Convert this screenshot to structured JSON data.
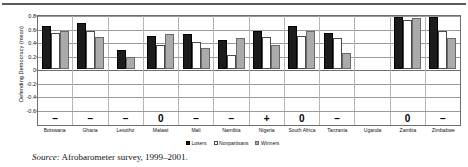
{
  "chart_data": {
    "type": "bar",
    "title": "",
    "subtitle": "",
    "xlabel": "",
    "ylabel": "Defending Democracy (mean)",
    "ylim": [
      -0.6,
      0.8
    ],
    "yticks": [
      0.8,
      0.6,
      0.4,
      0.2,
      0,
      -0.2,
      -0.4,
      -0.6
    ],
    "ytick_labels": [
      "0.8",
      "0.6",
      "0.4",
      "0.2",
      "0",
      "-0.2",
      "-0.4",
      "-0.6"
    ],
    "grid": true,
    "legend_position": "bottom-center",
    "categories": [
      "Botswana",
      "Ghana",
      "Lesotho",
      "Malawi",
      "Mali",
      "Namibia",
      "Nigeria",
      "South Africa",
      "Tanzania",
      "Uganda",
      "Zambia",
      "Zimbabwe"
    ],
    "series": [
      {
        "name": "Losers",
        "color": "#1c1c1c",
        "values": [
          0.63,
          0.67,
          0.28,
          0.48,
          0.51,
          0.43,
          0.56,
          0.62,
          0.52,
          null,
          0.76,
          0.75
        ]
      },
      {
        "name": "Nonpartisans",
        "color": "#ffffff",
        "values": [
          0.53,
          0.56,
          null,
          0.35,
          0.4,
          0.21,
          0.47,
          0.48,
          0.45,
          null,
          0.72,
          0.55
        ]
      },
      {
        "name": "Winners",
        "color": "#ababab",
        "values": [
          0.56,
          0.47,
          0.18,
          0.51,
          0.31,
          0.45,
          0.36,
          0.55,
          0.24,
          null,
          0.74,
          0.46
        ]
      }
    ],
    "annotations": {
      "significance_row_name": "winner-loser gap sign",
      "signs": [
        "–",
        "–",
        "–",
        "0",
        "–",
        "–",
        "+",
        "0",
        "–",
        "",
        "0",
        "–"
      ]
    }
  },
  "legend": {
    "items": [
      {
        "label": "Losers",
        "swatch": "losers"
      },
      {
        "label": "Nonpartisans",
        "swatch": "nonpartisans"
      },
      {
        "label": "Winners",
        "swatch": "winners"
      }
    ]
  },
  "source": {
    "prefix": "Source:",
    "text": " Afrobarometer survey, 1999–2001."
  }
}
